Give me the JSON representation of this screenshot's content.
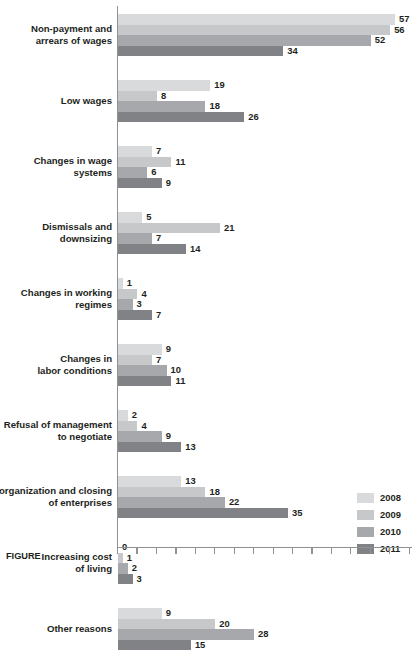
{
  "chart_data": {
    "type": "bar",
    "orientation": "horizontal",
    "title": "",
    "xlabel": "",
    "ylabel": "",
    "xlim": [
      0,
      60
    ],
    "grid": false,
    "legend_position": "bottom-right",
    "categories": [
      "Non-payment and arrears of wages",
      "Low wages",
      "Changes in wage systems",
      "Dismissals and downsizing",
      "Changes in working regimes",
      "Changes in labor conditions",
      "Refusal of management to negotiate",
      "Reorganization and closing of enterprises",
      "Increasing cost of living",
      "Other reasons"
    ],
    "category_lines": [
      [
        "Non-payment and",
        "arrears of wages"
      ],
      [
        "Low wages"
      ],
      [
        "Changes in wage",
        "systems"
      ],
      [
        "Dismissals and",
        "downsizing"
      ],
      [
        "Changes in working",
        "regimes"
      ],
      [
        "Changes in",
        "labor conditions"
      ],
      [
        "Refusal of management",
        "to negotiate"
      ],
      [
        "Reorganization and closing",
        "of enterprises"
      ],
      [
        "Increasing cost",
        "of living"
      ],
      [
        "Other reasons"
      ]
    ],
    "series": [
      {
        "name": "2008",
        "color": "#d9dadb",
        "values": [
          57,
          19,
          7,
          5,
          1,
          9,
          2,
          13,
          0,
          9
        ]
      },
      {
        "name": "2009",
        "color": "#c6c8ca",
        "values": [
          56,
          8,
          11,
          21,
          4,
          7,
          4,
          18,
          1,
          20
        ]
      },
      {
        "name": "2010",
        "color": "#a6a8ab",
        "values": [
          52,
          18,
          6,
          7,
          3,
          10,
          9,
          22,
          2,
          28
        ]
      },
      {
        "name": "2011",
        "color": "#808285",
        "values": [
          34,
          26,
          9,
          14,
          7,
          11,
          13,
          35,
          3,
          15
        ]
      }
    ],
    "axis_ticks": [
      0,
      4,
      8,
      12,
      16,
      20,
      24,
      28,
      32,
      36,
      40,
      44,
      48,
      52,
      56,
      60
    ],
    "px_per_unit": 4.86
  },
  "legend": {
    "items": [
      {
        "label": "2008",
        "color": "#d9dadb"
      },
      {
        "label": "2009",
        "color": "#c6c8ca"
      },
      {
        "label": "2010",
        "color": "#a6a8ab"
      },
      {
        "label": "2011",
        "color": "#808285"
      }
    ]
  },
  "caption": {
    "text": "FIGURE"
  }
}
